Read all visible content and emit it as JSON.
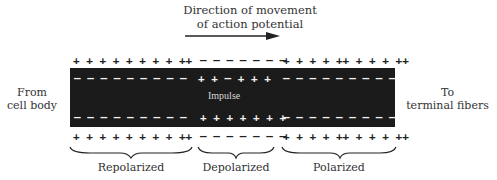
{
  "title": {
    "line1": "Direction of movement",
    "line2": "of action potential"
  },
  "left_label": {
    "line1": "From",
    "line2": "cell body"
  },
  "right_label": {
    "line1": "To",
    "line2": "terminal fibers"
  },
  "axon": {
    "center_label": "Impulse",
    "outer_top": {
      "repolarized": "+ + + + + + + + ++",
      "depolarized": "– – – – – – –",
      "polarized": "+ + + + ++ + + + ++"
    },
    "inner_top": {
      "repolarized": "– – – – – – – – –",
      "depolarized": "+ + – + + +",
      "polarized": "– – – – – – – – –"
    },
    "inner_bottom": {
      "repolarized": "– – – – – – – – –",
      "depolarized": "+ + + + + + +",
      "polarized": "– – – – – – – – –"
    },
    "outer_bottom": {
      "repolarized": "+ + + + + + + + ++",
      "depolarized": "– – – – – – –",
      "polarized": "+ + + + ++ + + + ++"
    }
  },
  "regions": [
    {
      "label": "Repolarized"
    },
    {
      "label": "Depolarized"
    },
    {
      "label": "Polarized"
    }
  ],
  "colors": {
    "axon_fill": "#1b1b1b",
    "text": "#333333",
    "background": "#ffffff"
  }
}
